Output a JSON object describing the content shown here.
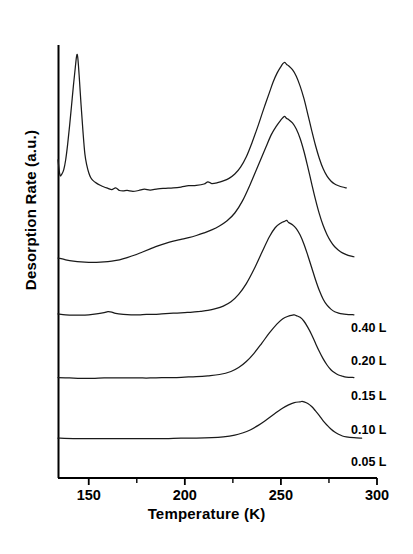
{
  "chart_data": {
    "type": "line",
    "title": "",
    "xlabel": "Temperature (K)",
    "ylabel": "Desorption Rate (a.u.)",
    "xlim": [
      134,
      300
    ],
    "ylim": [
      0,
      1
    ],
    "grid": false,
    "legend_position": "right-inline",
    "xticks": [
      150,
      200,
      250,
      300
    ],
    "xtick_labels": [
      "150",
      "200",
      "250",
      "300"
    ],
    "xminorticks": [
      175,
      225,
      275
    ],
    "yticks": [],
    "ytick_labels": [],
    "axis_style": "left-spine-and-bottom-spine-only",
    "note": "Offset-stacked TPD (temperature programmed desorption) spectra; curves vertically offset by exposure, y axis arbitrary units with no tick labels.",
    "series": [
      {
        "name": "0.40 L",
        "label": "0.40 L",
        "color": "#1a1a1a",
        "baseline_offset": 0.66,
        "low_temp_peak": {
          "temperature": 144,
          "present": true
        },
        "main_peak": {
          "temperature": 252,
          "relative_height": 0.3
        },
        "points": [
          [
            134,
            0.735
          ],
          [
            135,
            0.7
          ],
          [
            136,
            0.702
          ],
          [
            137,
            0.712
          ],
          [
            138,
            0.735
          ],
          [
            139,
            0.77
          ],
          [
            140,
            0.812
          ],
          [
            141,
            0.858
          ],
          [
            142,
            0.905
          ],
          [
            143,
            0.948
          ],
          [
            143.6,
            0.972
          ],
          [
            144,
            0.978
          ],
          [
            144.4,
            0.966
          ],
          [
            145,
            0.93
          ],
          [
            146,
            0.862
          ],
          [
            147,
            0.8
          ],
          [
            148,
            0.748
          ],
          [
            149,
            0.722
          ],
          [
            150,
            0.705
          ],
          [
            151,
            0.694
          ],
          [
            152,
            0.688
          ],
          [
            154,
            0.681
          ],
          [
            156,
            0.676
          ],
          [
            158,
            0.672
          ],
          [
            160,
            0.669
          ],
          [
            162,
            0.666
          ],
          [
            164,
            0.67
          ],
          [
            166,
            0.664
          ],
          [
            168,
            0.663
          ],
          [
            170,
            0.664
          ],
          [
            173,
            0.662
          ],
          [
            176,
            0.664
          ],
          [
            179,
            0.667
          ],
          [
            182,
            0.665
          ],
          [
            186,
            0.668
          ],
          [
            190,
            0.669
          ],
          [
            194,
            0.67
          ],
          [
            198,
            0.672
          ],
          [
            202,
            0.675
          ],
          [
            206,
            0.676
          ],
          [
            210,
            0.679
          ],
          [
            212,
            0.684
          ],
          [
            214,
            0.68
          ],
          [
            217,
            0.682
          ],
          [
            220,
            0.686
          ],
          [
            223,
            0.692
          ],
          [
            226,
            0.702
          ],
          [
            229,
            0.718
          ],
          [
            232,
            0.742
          ],
          [
            235,
            0.775
          ],
          [
            238,
            0.812
          ],
          [
            241,
            0.852
          ],
          [
            244,
            0.89
          ],
          [
            246,
            0.915
          ],
          [
            248,
            0.935
          ],
          [
            250,
            0.95
          ],
          [
            251,
            0.957
          ],
          [
            252,
            0.96
          ],
          [
            253,
            0.955
          ],
          [
            254,
            0.952
          ],
          [
            256,
            0.943
          ],
          [
            258,
            0.928
          ],
          [
            260,
            0.905
          ],
          [
            262,
            0.876
          ],
          [
            264,
            0.84
          ],
          [
            266,
            0.803
          ],
          [
            268,
            0.768
          ],
          [
            270,
            0.738
          ],
          [
            272,
            0.714
          ],
          [
            274,
            0.697
          ],
          [
            276,
            0.686
          ],
          [
            278,
            0.679
          ],
          [
            280,
            0.675
          ],
          [
            282,
            0.672
          ],
          [
            284,
            0.67
          ]
        ]
      },
      {
        "name": "0.20 L",
        "label": "0.20 L",
        "color": "#1a1a1a",
        "baseline_offset": 0.51,
        "main_peak": {
          "temperature": 252,
          "relative_height": 0.28
        },
        "points": [
          [
            134,
            0.508
          ],
          [
            138,
            0.504
          ],
          [
            142,
            0.501
          ],
          [
            146,
            0.499
          ],
          [
            150,
            0.498
          ],
          [
            154,
            0.498
          ],
          [
            158,
            0.499
          ],
          [
            162,
            0.501
          ],
          [
            166,
            0.504
          ],
          [
            170,
            0.509
          ],
          [
            174,
            0.515
          ],
          [
            178,
            0.522
          ],
          [
            182,
            0.529
          ],
          [
            186,
            0.536
          ],
          [
            190,
            0.542
          ],
          [
            194,
            0.547
          ],
          [
            198,
            0.551
          ],
          [
            202,
            0.555
          ],
          [
            206,
            0.56
          ],
          [
            210,
            0.566
          ],
          [
            214,
            0.573
          ],
          [
            218,
            0.582
          ],
          [
            222,
            0.594
          ],
          [
            226,
            0.612
          ],
          [
            230,
            0.64
          ],
          [
            234,
            0.678
          ],
          [
            238,
            0.72
          ],
          [
            242,
            0.762
          ],
          [
            245,
            0.793
          ],
          [
            248,
            0.815
          ],
          [
            250,
            0.827
          ],
          [
            251,
            0.832
          ],
          [
            252,
            0.835
          ],
          [
            253,
            0.83
          ],
          [
            254,
            0.828
          ],
          [
            256,
            0.82
          ],
          [
            258,
            0.806
          ],
          [
            260,
            0.784
          ],
          [
            262,
            0.754
          ],
          [
            264,
            0.718
          ],
          [
            266,
            0.68
          ],
          [
            268,
            0.643
          ],
          [
            270,
            0.61
          ],
          [
            272,
            0.583
          ],
          [
            274,
            0.562
          ],
          [
            276,
            0.546
          ],
          [
            278,
            0.534
          ],
          [
            280,
            0.526
          ],
          [
            282,
            0.52
          ],
          [
            284,
            0.516
          ],
          [
            286,
            0.513
          ],
          [
            288,
            0.511
          ]
        ]
      },
      {
        "name": "0.15 L",
        "label": "0.15 L",
        "color": "#1a1a1a",
        "baseline_offset": 0.375,
        "main_peak": {
          "temperature": 253,
          "relative_height": 0.215
        },
        "points": [
          [
            134,
            0.379
          ],
          [
            138,
            0.377
          ],
          [
            142,
            0.376
          ],
          [
            146,
            0.376
          ],
          [
            150,
            0.377
          ],
          [
            154,
            0.379
          ],
          [
            158,
            0.382
          ],
          [
            160,
            0.384
          ],
          [
            162,
            0.383
          ],
          [
            164,
            0.38
          ],
          [
            168,
            0.378
          ],
          [
            172,
            0.377
          ],
          [
            176,
            0.377
          ],
          [
            180,
            0.378
          ],
          [
            184,
            0.378
          ],
          [
            188,
            0.379
          ],
          [
            192,
            0.38
          ],
          [
            196,
            0.381
          ],
          [
            200,
            0.382
          ],
          [
            204,
            0.383
          ],
          [
            208,
            0.385
          ],
          [
            212,
            0.387
          ],
          [
            216,
            0.391
          ],
          [
            220,
            0.397
          ],
          [
            224,
            0.407
          ],
          [
            228,
            0.424
          ],
          [
            232,
            0.449
          ],
          [
            236,
            0.482
          ],
          [
            240,
            0.52
          ],
          [
            244,
            0.557
          ],
          [
            247,
            0.578
          ],
          [
            250,
            0.589
          ],
          [
            252,
            0.593
          ],
          [
            253,
            0.595
          ],
          [
            254,
            0.59
          ],
          [
            256,
            0.585
          ],
          [
            258,
            0.576
          ],
          [
            260,
            0.561
          ],
          [
            262,
            0.54
          ],
          [
            264,
            0.514
          ],
          [
            266,
            0.486
          ],
          [
            268,
            0.458
          ],
          [
            270,
            0.433
          ],
          [
            272,
            0.413
          ],
          [
            274,
            0.399
          ],
          [
            276,
            0.39
          ],
          [
            278,
            0.384
          ],
          [
            280,
            0.381
          ],
          [
            282,
            0.379
          ],
          [
            284,
            0.378
          ],
          [
            288,
            0.377
          ]
        ]
      },
      {
        "name": "0.10 L",
        "label": "0.10 L",
        "color": "#1a1a1a",
        "baseline_offset": 0.23,
        "main_peak": {
          "temperature": 257,
          "relative_height": 0.14
        },
        "points": [
          [
            134,
            0.232
          ],
          [
            140,
            0.231
          ],
          [
            146,
            0.23
          ],
          [
            152,
            0.23
          ],
          [
            158,
            0.231
          ],
          [
            164,
            0.231
          ],
          [
            170,
            0.231
          ],
          [
            176,
            0.231
          ],
          [
            182,
            0.231
          ],
          [
            188,
            0.232
          ],
          [
            194,
            0.232
          ],
          [
            200,
            0.233
          ],
          [
            206,
            0.234
          ],
          [
            212,
            0.236
          ],
          [
            218,
            0.239
          ],
          [
            224,
            0.246
          ],
          [
            228,
            0.255
          ],
          [
            232,
            0.269
          ],
          [
            236,
            0.288
          ],
          [
            240,
            0.311
          ],
          [
            244,
            0.335
          ],
          [
            248,
            0.356
          ],
          [
            251,
            0.368
          ],
          [
            254,
            0.374
          ],
          [
            256,
            0.376
          ],
          [
            257,
            0.377
          ],
          [
            258,
            0.375
          ],
          [
            260,
            0.371
          ],
          [
            262,
            0.362
          ],
          [
            264,
            0.348
          ],
          [
            266,
            0.331
          ],
          [
            268,
            0.311
          ],
          [
            270,
            0.292
          ],
          [
            272,
            0.275
          ],
          [
            274,
            0.261
          ],
          [
            276,
            0.25
          ],
          [
            278,
            0.243
          ],
          [
            280,
            0.238
          ],
          [
            282,
            0.235
          ],
          [
            284,
            0.233
          ],
          [
            288,
            0.232
          ]
        ]
      },
      {
        "name": "0.05 L",
        "label": "0.05 L",
        "color": "#1a1a1a",
        "baseline_offset": 0.09,
        "main_peak": {
          "temperature": 261,
          "relative_height": 0.085
        },
        "points": [
          [
            134,
            0.092
          ],
          [
            142,
            0.091
          ],
          [
            150,
            0.091
          ],
          [
            158,
            0.091
          ],
          [
            166,
            0.091
          ],
          [
            174,
            0.091
          ],
          [
            182,
            0.091
          ],
          [
            190,
            0.091
          ],
          [
            198,
            0.092
          ],
          [
            206,
            0.092
          ],
          [
            214,
            0.093
          ],
          [
            220,
            0.095
          ],
          [
            226,
            0.099
          ],
          [
            230,
            0.104
          ],
          [
            234,
            0.111
          ],
          [
            238,
            0.121
          ],
          [
            242,
            0.133
          ],
          [
            246,
            0.146
          ],
          [
            250,
            0.159
          ],
          [
            254,
            0.169
          ],
          [
            257,
            0.174
          ],
          [
            260,
            0.176
          ],
          [
            261,
            0.177
          ],
          [
            262,
            0.176
          ],
          [
            264,
            0.172
          ],
          [
            266,
            0.165
          ],
          [
            268,
            0.155
          ],
          [
            270,
            0.144
          ],
          [
            272,
            0.132
          ],
          [
            274,
            0.122
          ],
          [
            276,
            0.113
          ],
          [
            278,
            0.106
          ],
          [
            280,
            0.101
          ],
          [
            282,
            0.097
          ],
          [
            284,
            0.095
          ],
          [
            288,
            0.093
          ],
          [
            292,
            0.092
          ]
        ]
      }
    ],
    "series_labels": [
      {
        "text": "0.40 L",
        "x": 351,
        "y": 330
      },
      {
        "text": "0.20 L",
        "x": 351,
        "y": 363
      },
      {
        "text": "0.15 L",
        "x": 351,
        "y": 398
      },
      {
        "text": "0.10 L",
        "x": 351,
        "y": 432
      },
      {
        "text": "0.05 L",
        "x": 351,
        "y": 464
      }
    ]
  },
  "axes": {
    "x_title": "Temperature (K)",
    "y_title": "Desorption Rate (a.u.)",
    "x_tick_labels": [
      "150",
      "200",
      "250",
      "300"
    ]
  },
  "colors": {
    "background": "#ffffff",
    "ink": "#000000",
    "curve": "#1a1a1a"
  }
}
